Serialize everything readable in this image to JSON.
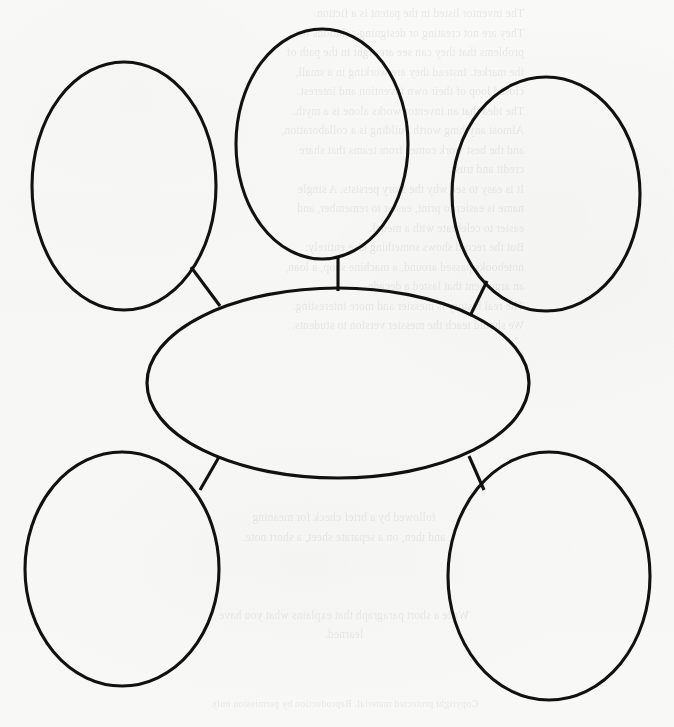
{
  "document": {
    "kind": "scanned-worksheet",
    "title": "Blank Concept Map Graphic Organizer",
    "background_color": "#f7f7f6",
    "ink_color": "#111111",
    "width": 674,
    "height": 727
  },
  "diagram": {
    "type": "concept-map",
    "stroke_color": "#111111",
    "stroke_width": 3.1,
    "fill_color": "none",
    "center_node": {
      "id": "center-oval",
      "label": "",
      "cx": 338,
      "cy": 383,
      "rx": 191,
      "ry": 95
    },
    "outer_nodes": [
      {
        "id": "outer-oval-top-left",
        "label": "",
        "cx": 124,
        "cy": 186,
        "rx": 92,
        "ry": 124
      },
      {
        "id": "outer-oval-top-center",
        "label": "",
        "cx": 322,
        "cy": 144,
        "rx": 86,
        "ry": 115
      },
      {
        "id": "outer-oval-top-right",
        "label": "",
        "cx": 546,
        "cy": 194,
        "rx": 94,
        "ry": 117
      },
      {
        "id": "outer-oval-bottom-left",
        "label": "",
        "cx": 122,
        "cy": 569,
        "rx": 97,
        "ry": 117
      },
      {
        "id": "outer-oval-bottom-right",
        "label": "",
        "cx": 549,
        "cy": 576,
        "rx": 101,
        "ry": 124
      }
    ],
    "connectors": [
      {
        "id": "connector-top-left",
        "from": "outer-oval-top-left",
        "to": "center-oval",
        "x1": 191,
        "y1": 267,
        "x2": 220,
        "y2": 306
      },
      {
        "id": "connector-top-center",
        "from": "outer-oval-top-center",
        "to": "center-oval",
        "x1": 338,
        "y1": 258,
        "x2": 338,
        "y2": 291
      },
      {
        "id": "connector-top-right",
        "from": "outer-oval-top-right",
        "to": "center-oval",
        "x1": 487,
        "y1": 281,
        "x2": 470,
        "y2": 316
      },
      {
        "id": "connector-bottom-left",
        "from": "outer-oval-bottom-left",
        "to": "center-oval",
        "x1": 219,
        "y1": 457,
        "x2": 200,
        "y2": 490
      },
      {
        "id": "connector-bottom-right",
        "from": "outer-oval-bottom-right",
        "to": "center-oval",
        "x1": 469,
        "y1": 456,
        "x2": 484,
        "y2": 490
      }
    ]
  },
  "bleed_through": {
    "description": "faint mirrored text showing through from the reverse side of the scanned sheet",
    "opacity": 0.085,
    "blocks": [
      {
        "id": "bleed-block-top",
        "left": 150,
        "top": 4,
        "width": 500,
        "text": "The inventor listed in the patent is a fiction.\nThey are not creating or designing solutions for\nproblems that they can see are right in the path of\nthe market. Instead they are working in a small,\nclosed loop of their own invention and interest.\nThe idea that an inventor works alone is a myth.\nAlmost anything worth building is a collaboration,\nand the best work comes from teams that share\ncredit and trust.\nIt is easy to see why the story persists. A single\nname is easier to print, easier to remember, and\neasier to celebrate with a medal.\nBut the record shows something else entirely:\nnotebooks passed around, a machine shop, a loan,\nan argument that lasted a decade.\nThe real history is messier and more interesting.\nWe should teach the messier version to students."
      },
      {
        "id": "bleed-block-bottom",
        "left": 120,
        "top": 508,
        "width": 420,
        "text": "followed by a brief check for meaning\nand then, on a separate sheet, a short note.\n\n\n\nWrite a short paragraph that explains what you have\nlearned."
      },
      {
        "id": "bleed-block-footer",
        "left": 70,
        "top": 694,
        "width": 520,
        "text": "Copyright protected material. Reproduction by permission only."
      }
    ]
  }
}
